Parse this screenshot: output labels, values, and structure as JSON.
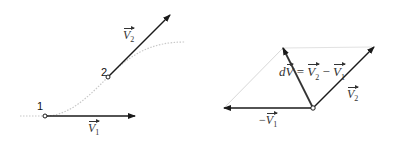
{
  "left_diagram": {
    "point_1_label": "1",
    "point_2_label": "2",
    "v1_symbol": "V",
    "v1_sub": "1",
    "v2_symbol": "V",
    "v2_sub": "2",
    "path": "dotted curve trajectory"
  },
  "right_diagram": {
    "dv_prefix": "d",
    "dv_symbol": "V",
    "equals": "=",
    "minus": "−",
    "v1_symbol": "V",
    "v1_sub": "1",
    "v2_symbol": "V",
    "v2_sub": "2",
    "neg_v1_minus": "−",
    "neg_v1_symbol": "V",
    "neg_v1_sub": "1"
  },
  "colors": {
    "arrow": "#1a1a1a",
    "guide": "#d0d0d0",
    "dotted": "#c8c8c8"
  }
}
